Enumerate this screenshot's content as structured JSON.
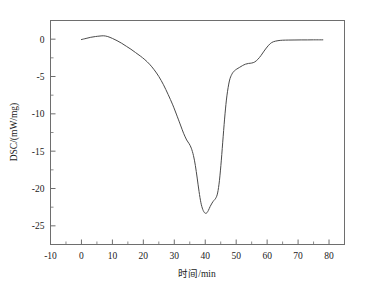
{
  "chart_data": {
    "type": "line",
    "title": "",
    "subtitle": "",
    "xlabel": "时间/min",
    "ylabel": "DSC/(mW/mg)",
    "xlim": [
      -10,
      85
    ],
    "ylim": [
      -27.5,
      2.5
    ],
    "xticks": [
      -10,
      0,
      10,
      20,
      30,
      40,
      50,
      60,
      70,
      80
    ],
    "yticks": [
      0,
      -5,
      -10,
      -15,
      -20,
      -25
    ],
    "xtick_labels": [
      "-10",
      "0",
      "10",
      "20",
      "30",
      "40",
      "50",
      "60",
      "70",
      "80"
    ],
    "ytick_labels": [
      "0",
      "-5",
      "-10",
      "-15",
      "-20",
      "-25"
    ],
    "minor_ticks_per_interval": 1,
    "grid": false,
    "legend": null,
    "legend_position": "none",
    "line_color": "#4a4a4a",
    "frame_color": "#6e6e6e",
    "series": [
      {
        "name": "DSC",
        "x": [
          0.0,
          1.5,
          3.0,
          4.5,
          6.0,
          7.2,
          8.5,
          10.0,
          11.5,
          13.0,
          14.5,
          16.0,
          17.5,
          19.0,
          20.5,
          22.0,
          23.5,
          25.0,
          26.5,
          28.0,
          29.5,
          31.0,
          32.0,
          33.0,
          34.0,
          34.8,
          35.5,
          36.2,
          36.8,
          37.4,
          38.0,
          38.6,
          39.2,
          39.8,
          40.4,
          41.0,
          41.6,
          42.2,
          42.8,
          43.4,
          44.0,
          44.6,
          45.2,
          45.8,
          46.4,
          47.0,
          47.8,
          48.6,
          49.4,
          50.2,
          51.0,
          52.0,
          53.0,
          54.0,
          55.0,
          56.0,
          57.0,
          58.0,
          59.0,
          60.0,
          61.0,
          62.0,
          63.5,
          65.0,
          67.0,
          69.0,
          71.0,
          73.0,
          75.0,
          77.0,
          78.0
        ],
        "y": [
          -0.05,
          0.1,
          0.25,
          0.35,
          0.42,
          0.45,
          0.35,
          0.1,
          -0.2,
          -0.55,
          -0.95,
          -1.35,
          -1.8,
          -2.25,
          -2.75,
          -3.35,
          -4.1,
          -5.0,
          -6.1,
          -7.4,
          -8.8,
          -10.4,
          -11.5,
          -12.6,
          -13.5,
          -14.0,
          -14.6,
          -15.6,
          -16.9,
          -18.6,
          -20.4,
          -21.9,
          -22.8,
          -23.25,
          -23.3,
          -22.95,
          -22.4,
          -21.95,
          -21.6,
          -21.3,
          -20.6,
          -18.9,
          -16.2,
          -13.0,
          -10.0,
          -7.6,
          -5.6,
          -4.7,
          -4.25,
          -4.0,
          -3.8,
          -3.55,
          -3.35,
          -3.25,
          -3.2,
          -3.05,
          -2.7,
          -2.2,
          -1.6,
          -1.05,
          -0.6,
          -0.35,
          -0.2,
          -0.14,
          -0.12,
          -0.11,
          -0.1,
          -0.1,
          -0.09,
          -0.09,
          -0.09
        ]
      }
    ]
  },
  "figure": {
    "background_color": "#ffffff"
  }
}
